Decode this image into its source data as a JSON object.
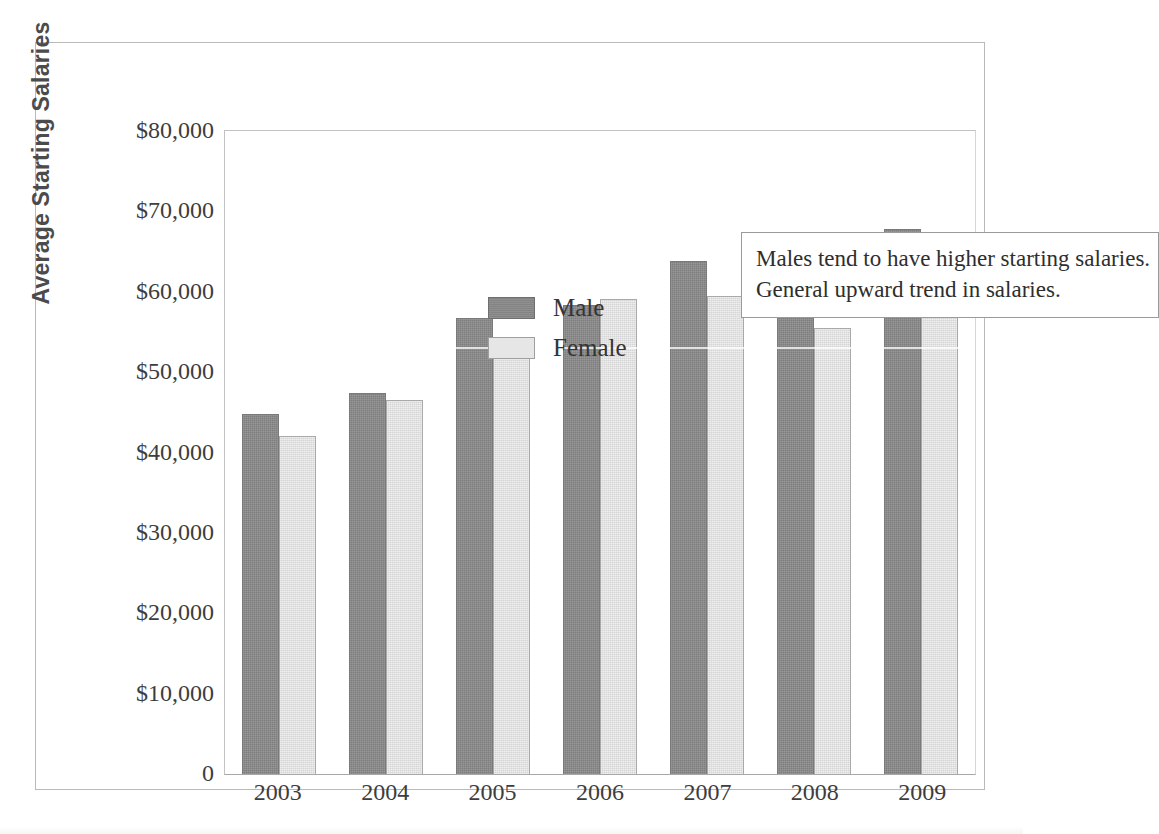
{
  "chart_data": {
    "type": "bar",
    "title": "",
    "xlabel": "",
    "ylabel": "Average Starting Salaries",
    "categories": [
      "2003",
      "2004",
      "2005",
      "2006",
      "2007",
      "2008",
      "2009"
    ],
    "series": [
      {
        "name": "Male",
        "color": "#8a8a8a",
        "values": [
          44800,
          47400,
          56700,
          58300,
          63800,
          61400,
          67800
        ]
      },
      {
        "name": "Female",
        "color": "#e3e3e3",
        "values": [
          42000,
          46500,
          54000,
          59100,
          59500,
          55500,
          64700
        ]
      }
    ],
    "ylim": [
      0,
      80000
    ],
    "ytick_values": [
      80000,
      70000,
      60000,
      50000,
      40000,
      30000,
      20000,
      10000,
      0
    ],
    "ytick_labels": [
      "$80,000",
      "$70,000",
      "$60,000",
      "$50,000",
      "$40,000",
      "$30,000",
      "$20,000",
      "$10,000",
      "0"
    ],
    "grid": false,
    "legend_position": "upper-left-inside",
    "annotations": [
      "Males tend to have higher starting salaries.",
      "General upward trend in salaries."
    ]
  },
  "legend": {
    "items": [
      {
        "label": "Male"
      },
      {
        "label": "Female"
      }
    ]
  },
  "annotation": {
    "line1": "Males tend to have higher starting salaries.",
    "line2": "General upward trend in salaries."
  }
}
